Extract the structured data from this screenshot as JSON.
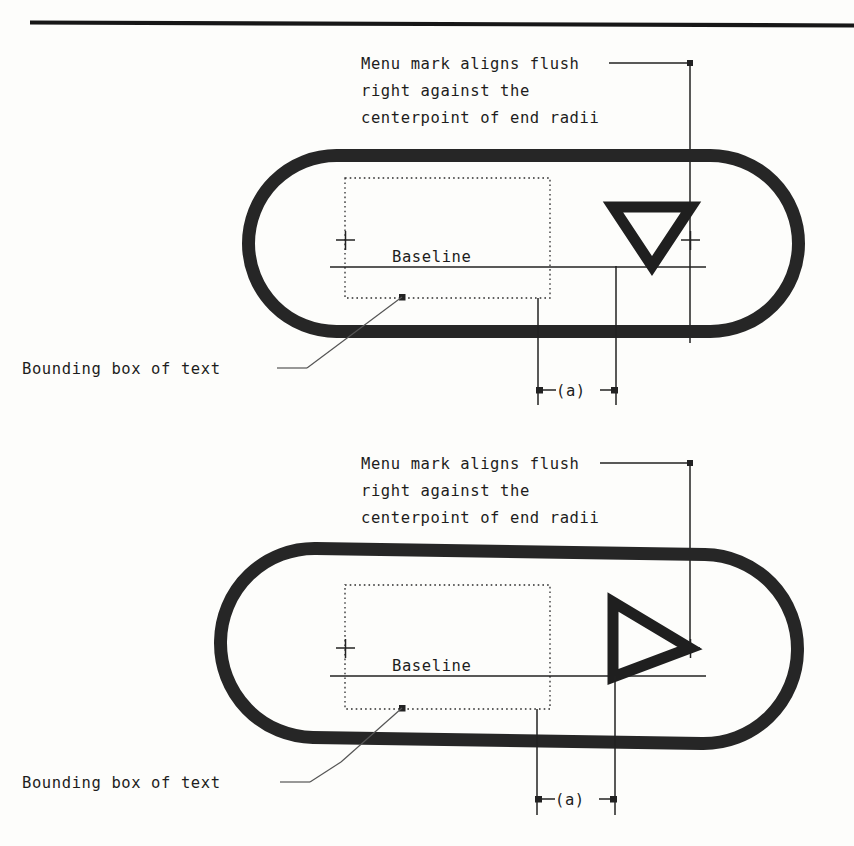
{
  "page": {
    "background_color": "#fdfdfb",
    "ink_color": "#1f1f1f",
    "width": 854,
    "height": 846,
    "top_rule": true
  },
  "figures": [
    {
      "id": "figure-top",
      "callout_text_line1": "Menu mark aligns flush",
      "callout_text_line2": "right against the",
      "callout_text_line3": "centerpoint of end radii",
      "baseline_label": "Baseline",
      "bounding_box_label": "Bounding box of text",
      "dimension_label": "(a)",
      "menu_mark": "triangle-down",
      "capsule": {
        "x": 242,
        "y": 149,
        "width": 563,
        "height": 189
      },
      "text_bbox": {
        "x": 345,
        "y": 178,
        "width": 205,
        "height": 120
      },
      "baseline_y": 267,
      "centerpoint_x": 690
    },
    {
      "id": "figure-bottom",
      "callout_text_line1": "Menu mark aligns flush",
      "callout_text_line2": "right against the",
      "callout_text_line3": "centerpoint of end radii",
      "baseline_label": "Baseline",
      "bounding_box_label": "Bounding box of text",
      "dimension_label": "(a)",
      "menu_mark": "triangle-right",
      "capsule": {
        "x": 214,
        "y": 545,
        "width": 590,
        "height": 202
      },
      "text_bbox": {
        "x": 345,
        "y": 585,
        "width": 205,
        "height": 124
      },
      "baseline_y": 676,
      "centerpoint_x": 690
    }
  ],
  "labels": {
    "caption_1_l1": "Menu mark aligns flush",
    "caption_1_l2": "right against the",
    "caption_1_l3": "centerpoint of end radii",
    "caption_2_l1": "Menu mark aligns flush",
    "caption_2_l2": "right against the",
    "caption_2_l3": "centerpoint of end radii",
    "baseline_1": "Baseline",
    "baseline_2": "Baseline",
    "bbox_1": "Bounding box of text",
    "bbox_2": "Bounding box of text",
    "dim_1": "(a)",
    "dim_2": "(a)"
  }
}
